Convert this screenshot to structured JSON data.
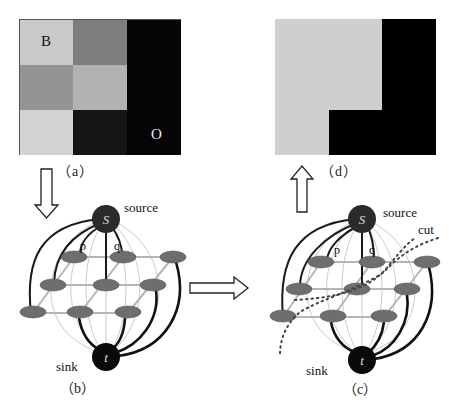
{
  "panel_a": {
    "caption": "（a）",
    "grid": [
      [
        {
          "color": "#c9c9c9",
          "label": "B"
        },
        {
          "color": "#7e7e7e",
          "label": ""
        },
        {
          "color": "#050505",
          "label": ""
        }
      ],
      [
        {
          "color": "#949494",
          "label": ""
        },
        {
          "color": "#b2b2b2",
          "label": ""
        },
        {
          "color": "#050505",
          "label": ""
        }
      ],
      [
        {
          "color": "#d2d2d2",
          "label": ""
        },
        {
          "color": "#151515",
          "label": ""
        },
        {
          "color": "#050505",
          "label": "O"
        }
      ]
    ],
    "labels": {
      "background": "B",
      "object": "O"
    }
  },
  "panel_d": {
    "caption": "（d）",
    "background_color": "#cfcfcf",
    "object_color": "#000000"
  },
  "panel_b": {
    "caption": "（b）",
    "source_label": "source",
    "sink_label": "sink",
    "source_node": "S",
    "sink_node": "t",
    "pixel_labels": [
      "p",
      "q"
    ]
  },
  "panel_c": {
    "caption": "（c）",
    "source_label": "source",
    "sink_label": "sink",
    "cut_label": "cut",
    "source_node": "S",
    "sink_node": "t",
    "pixel_labels": [
      "p",
      "q"
    ]
  },
  "colors": {
    "node_fill": "#6e6e6e",
    "terminal_fill": "#2a2a2a",
    "sink_fill": "#0a0a0a",
    "n_link": "#b8b8b8",
    "t_link_strong": "#1a1a1a",
    "t_link_weak": "#bdbdbd",
    "cut_dots": "#444444"
  }
}
